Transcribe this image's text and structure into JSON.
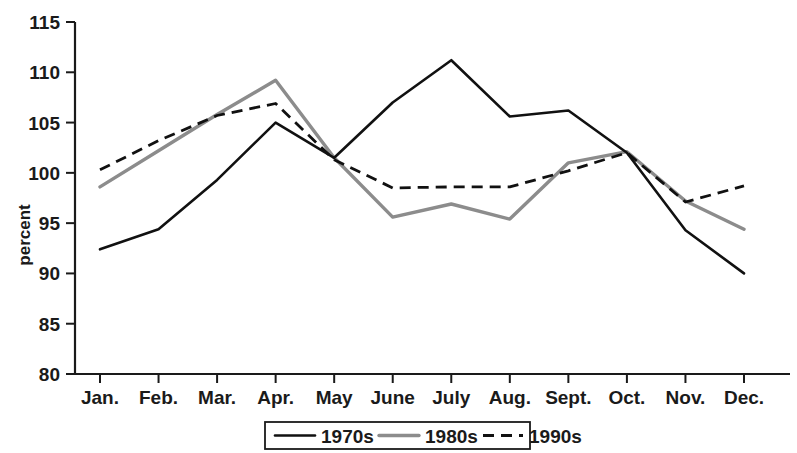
{
  "chart_data": {
    "type": "line",
    "title": "",
    "xlabel": "",
    "ylabel": "percent",
    "categories": [
      "Jan.",
      "Feb.",
      "Mar.",
      "Apr.",
      "May",
      "June",
      "July",
      "Aug.",
      "Sept.",
      "Oct.",
      "Nov.",
      "Dec."
    ],
    "ylim": [
      80,
      115
    ],
    "yticks": [
      80,
      85,
      90,
      95,
      100,
      105,
      110,
      115
    ],
    "ytick_labels": [
      "80",
      "85",
      "90",
      "95",
      "100",
      "105",
      "110",
      "115"
    ],
    "grid": false,
    "legend_position": "bottom-center",
    "series": [
      {
        "name": "1970s",
        "style": "solid",
        "color": "#111111",
        "values": [
          92.4,
          94.4,
          99.3,
          105.0,
          101.5,
          107.0,
          111.2,
          105.6,
          106.2,
          102.0,
          94.3,
          90.0
        ]
      },
      {
        "name": "1980s",
        "style": "solid",
        "color": "#8c8c8c",
        "values": [
          98.6,
          102.2,
          105.8,
          109.2,
          101.5,
          95.6,
          96.9,
          95.4,
          101.0,
          102.1,
          97.2,
          94.4
        ]
      },
      {
        "name": "1990s",
        "style": "dashed",
        "color": "#111111",
        "values": [
          100.3,
          103.2,
          105.7,
          106.9,
          101.3,
          98.5,
          98.6,
          98.6,
          100.2,
          102.0,
          97.1,
          98.7
        ]
      }
    ]
  },
  "legend": {
    "items": [
      {
        "label": "1970s"
      },
      {
        "label": "1980s"
      },
      {
        "label": "1990s"
      }
    ]
  },
  "axes": {
    "y_title": "percent"
  }
}
